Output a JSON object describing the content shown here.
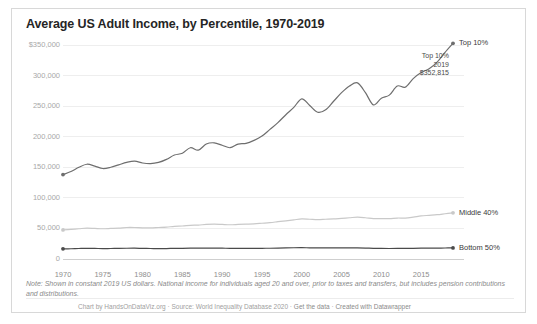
{
  "chart_title": "Average US Adult Income, by Percentile, 1970-2019",
  "note": "Note: Shown in constant 2019 US dollars. National income for individuals aged 20 and over, prior to taxes and transfers, but includes pension contributions and distributions.",
  "credit": {
    "full": "Chart by HandsOnDataViz.org · Source: World Inequality Database 2020 · Get the data · Created with Datawrapper",
    "chart_by": "Chart by HandsOnDataViz.org",
    "source": "Source: World Inequality Database 2020",
    "get_the_data": "Get the data",
    "created_with": "Created with Datawrapper",
    "separator": " · "
  },
  "annotation": {
    "series": "Top 10%",
    "year": "2019",
    "value": "$352,815"
  },
  "colors": {
    "top10": "#6e6e6e",
    "middle40": "#c9c9c9",
    "bottom50": "#4a4a4a",
    "gridline": "#eeeeee",
    "axis_text": "#a8a8a8",
    "title_text": "#252525",
    "card_border": "#d8d8d8",
    "background": "#ffffff"
  },
  "chart_data": {
    "type": "line",
    "title": "Average US Adult Income, by Percentile, 1970-2019",
    "xlabel": "",
    "ylabel": "",
    "xlim": [
      1970,
      2019
    ],
    "ylim": [
      0,
      350000
    ],
    "grid": true,
    "legend_position": "right-inline",
    "ytick_labels": [
      "$350,000",
      "300,000",
      "250,000",
      "200,000",
      "150,000",
      "100,000",
      "50,000",
      "0"
    ],
    "ytick_values": [
      350000,
      300000,
      250000,
      200000,
      150000,
      100000,
      50000,
      0
    ],
    "xtick_labels": [
      "1970",
      "1975",
      "1980",
      "1985",
      "1990",
      "1995",
      "2000",
      "2005",
      "2010",
      "2015"
    ],
    "xtick_values": [
      1970,
      1975,
      1980,
      1985,
      1990,
      1995,
      2000,
      2005,
      2010,
      2015
    ],
    "x": [
      1970,
      1971,
      1972,
      1973,
      1974,
      1975,
      1976,
      1977,
      1978,
      1979,
      1980,
      1981,
      1982,
      1983,
      1984,
      1985,
      1986,
      1987,
      1988,
      1989,
      1990,
      1991,
      1992,
      1993,
      1994,
      1995,
      1996,
      1997,
      1998,
      1999,
      2000,
      2001,
      2002,
      2003,
      2004,
      2005,
      2006,
      2007,
      2008,
      2009,
      2010,
      2011,
      2012,
      2013,
      2014,
      2015,
      2016,
      2017,
      2018,
      2019
    ],
    "series": [
      {
        "name": "Top 10%",
        "color": "#6e6e6e",
        "label_end": "Top 10%",
        "values": [
          138000,
          143000,
          150000,
          155000,
          152000,
          148000,
          150000,
          154000,
          158000,
          160000,
          157000,
          156000,
          158000,
          163000,
          170000,
          173000,
          182000,
          178000,
          188000,
          190000,
          186000,
          182000,
          188000,
          189000,
          194000,
          201000,
          212000,
          223000,
          236000,
          248000,
          262000,
          251000,
          240000,
          244000,
          258000,
          272000,
          283000,
          288000,
          272000,
          252000,
          263000,
          268000,
          283000,
          281000,
          295000,
          305000,
          311000,
          322000,
          338000,
          352815
        ]
      },
      {
        "name": "Middle 40%",
        "color": "#c9c9c9",
        "label_end": "Middle 40%",
        "values": [
          47500,
          48500,
          49500,
          50500,
          50000,
          49500,
          50000,
          50500,
          51500,
          51500,
          51000,
          51000,
          51500,
          52000,
          53500,
          54000,
          55000,
          55500,
          56500,
          57000,
          56500,
          56000,
          56500,
          57000,
          57500,
          58500,
          59500,
          61000,
          62500,
          64000,
          65500,
          65000,
          64500,
          65000,
          65500,
          66500,
          67500,
          68500,
          67500,
          66000,
          66000,
          66000,
          67000,
          67000,
          68500,
          70500,
          71500,
          72500,
          74000,
          75500
        ]
      },
      {
        "name": "Bottom 50%",
        "color": "#4a4a4a",
        "label_end": "Bottom 50%",
        "values": [
          16600,
          16800,
          17200,
          17500,
          17300,
          17000,
          17200,
          17300,
          17600,
          17700,
          17400,
          17200,
          17000,
          17100,
          17400,
          17500,
          17700,
          17700,
          17800,
          17900,
          17700,
          17400,
          17400,
          17300,
          17400,
          17500,
          17600,
          17800,
          18100,
          18400,
          18500,
          18300,
          18200,
          18100,
          18100,
          18100,
          18200,
          18200,
          17900,
          17400,
          17300,
          17200,
          17300,
          17300,
          17500,
          17700,
          17800,
          17900,
          18000,
          18100
        ]
      }
    ]
  }
}
